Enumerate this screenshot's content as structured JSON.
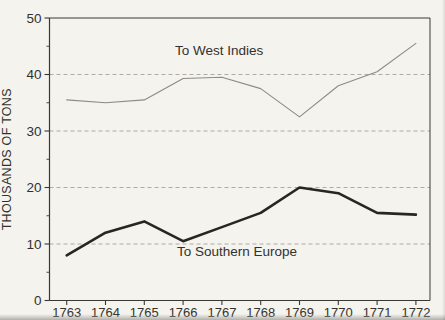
{
  "figure": {
    "background_color": "#f4f3ee",
    "scan_edge_color": "#b9b8b3"
  },
  "chart_data": {
    "type": "line",
    "title": "",
    "xlabel": "",
    "ylabel": "THOUSANDS OF TONS",
    "x": [
      1763,
      1764,
      1765,
      1766,
      1767,
      1768,
      1769,
      1770,
      1771,
      1772
    ],
    "ylim": [
      0,
      50
    ],
    "yticks": [
      0,
      10,
      20,
      30,
      40,
      50
    ],
    "yticks_minor": [
      5,
      15,
      25,
      35,
      45
    ],
    "gridlines_y": [
      10,
      20,
      30,
      40
    ],
    "grid_style": "dashed",
    "legend_position": "inline-annotations",
    "axis_color": "#3a3833",
    "grid_color": "#a5a39b",
    "text_color": "#33312c",
    "series": [
      {
        "name": "To West Indies",
        "values": [
          35.5,
          35,
          35.5,
          39.3,
          39.5,
          37.5,
          32.5,
          38,
          40.5,
          45.5
        ],
        "color": "#8d8b83",
        "stroke_width": 1.1
      },
      {
        "name": "To Southern Europe",
        "values": [
          8,
          12,
          14,
          10.5,
          13,
          15.5,
          20,
          19,
          15.5,
          15.2
        ],
        "color": "#262622",
        "stroke_width": 2.6
      }
    ],
    "annotations": [
      {
        "text": "To West Indies",
        "x_index": 2.79,
        "y_value": 43.5
      },
      {
        "text": "To Southern Europe",
        "x_index": 2.84,
        "y_value": 7.8
      }
    ]
  }
}
